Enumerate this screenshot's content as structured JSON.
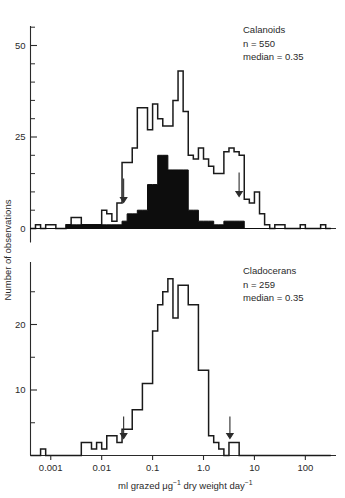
{
  "figure": {
    "y_axis_title": "Number of observations",
    "x_axis_title_parts": [
      "ml grazed ",
      "μg",
      "−1",
      " dry weight day",
      "−1"
    ],
    "x_axis_title_plain": "ml grazed μg⁻¹ dry weight day⁻¹"
  },
  "panels": [
    {
      "id": "calanoids",
      "annotation": {
        "taxon": "Calanoids",
        "n_label": "n  =  550",
        "median_label": "median  =  0.35"
      },
      "y_ticks_major": [
        0,
        25,
        50
      ],
      "y_tick_labels": [
        "0",
        "25",
        "50"
      ],
      "y_minor_step": 5,
      "y_max_axis": 60,
      "arrows": [
        0.027,
        5.0
      ]
    },
    {
      "id": "cladocerans",
      "annotation": {
        "taxon": "Cladocerans",
        "n_label": "n  =  259",
        "median_label": "median  =  0.35"
      },
      "y_ticks_major": [
        10,
        20
      ],
      "y_tick_labels": [
        "10",
        "20"
      ],
      "y_minor_step": 5,
      "y_max_axis": 30,
      "arrows": [
        0.027,
        3.3
      ]
    }
  ],
  "x_axis": {
    "scale": "log10",
    "tick_values": [
      0.001,
      0.01,
      0.1,
      1.0,
      10,
      100
    ],
    "tick_labels": [
      "0.001",
      "0.01",
      "0.1",
      "1.0",
      "10",
      "100"
    ],
    "min": 0.0004,
    "max": 400
  },
  "chart_data": {
    "type": "bar",
    "title": "",
    "subtitle": "",
    "xlabel": "ml grazed μg⁻¹ dry weight day⁻¹",
    "ylabel": "Number of observations",
    "grid": false,
    "legend_position": "none",
    "x_scale": "log10",
    "bin_width_decades": 0.1,
    "charts": [
      {
        "name": "Calanoids",
        "n": 550,
        "median": 0.35,
        "ylim": [
          0,
          60
        ],
        "yticks": [
          0,
          25,
          50
        ],
        "annotations": [
          "Calanoids",
          "n = 550",
          "median = 0.35"
        ],
        "arrow_x": [
          0.027,
          5.0
        ],
        "series": [
          {
            "name": "all observations (open outline)",
            "style": "open",
            "bin_left_log10": [
              -3.4,
              -3.3,
              -3.2,
              -3.1,
              -3.0,
              -2.9,
              -2.8,
              -2.7,
              -2.6,
              -2.5,
              -2.4,
              -2.3,
              -2.2,
              -2.1,
              -2.0,
              -1.9,
              -1.8,
              -1.7,
              -1.6,
              -1.5,
              -1.4,
              -1.3,
              -1.2,
              -1.1,
              -1.0,
              -0.9,
              -0.8,
              -0.7,
              -0.6,
              -0.5,
              -0.4,
              -0.3,
              -0.2,
              -0.1,
              0.0,
              0.1,
              0.2,
              0.3,
              0.4,
              0.5,
              0.6,
              0.7,
              0.8,
              0.9,
              1.0,
              1.1,
              1.2,
              1.3,
              1.4,
              1.5,
              1.6,
              1.7,
              1.8,
              1.9,
              2.0,
              2.1,
              2.2,
              2.3,
              2.4
            ],
            "values": [
              0,
              1,
              0,
              1,
              1,
              0,
              0,
              1,
              3,
              3,
              1,
              1,
              1,
              1,
              5,
              4,
              2,
              7,
              18,
              18,
              22,
              33,
              33,
              27,
              34,
              30,
              28,
              28,
              35,
              43,
              32,
              20,
              19,
              22,
              19,
              17,
              15,
              15,
              21,
              22,
              21,
              20,
              8,
              7,
              10,
              4,
              1,
              0,
              1,
              1,
              0,
              0,
              0,
              1,
              0,
              0,
              0,
              1,
              0
            ]
          },
          {
            "name": "filtered subset (solid black)",
            "style": "filled",
            "bin_left_log10": [
              -3.4,
              -3.3,
              -3.2,
              -3.1,
              -3.0,
              -2.9,
              -2.8,
              -2.7,
              -2.6,
              -2.5,
              -2.4,
              -2.3,
              -2.2,
              -2.1,
              -2.0,
              -1.9,
              -1.8,
              -1.7,
              -1.6,
              -1.5,
              -1.4,
              -1.3,
              -1.2,
              -1.1,
              -1.0,
              -0.9,
              -0.8,
              -0.7,
              -0.6,
              -0.5,
              -0.4,
              -0.3,
              -0.2,
              -0.1,
              0.0,
              0.1,
              0.2,
              0.3,
              0.4,
              0.5,
              0.6,
              0.7,
              0.8,
              0.9,
              1.0,
              1.1,
              1.2,
              1.3,
              1.4,
              1.5,
              1.6,
              1.7,
              1.8,
              1.9,
              2.0,
              2.1,
              2.2,
              2.3,
              2.4
            ],
            "values": [
              0,
              0,
              0,
              0,
              0,
              0,
              0,
              1,
              1,
              1,
              1,
              1,
              1,
              1,
              1,
              1,
              1,
              1,
              2,
              4,
              4,
              5,
              5,
              12,
              12,
              20,
              20,
              16,
              16,
              16,
              16,
              5,
              5,
              2,
              2,
              2,
              1,
              1,
              2,
              2,
              2,
              2,
              0,
              0,
              0,
              0,
              0,
              0,
              0,
              0,
              0,
              0,
              0,
              0,
              0,
              0,
              0,
              0,
              0
            ]
          }
        ]
      },
      {
        "name": "Cladocerans",
        "n": 259,
        "median": 0.35,
        "ylim": [
          0,
          30
        ],
        "yticks": [
          10,
          20
        ],
        "annotations": [
          "Cladocerans",
          "n = 259",
          "median = 0.35"
        ],
        "arrow_x": [
          0.027,
          3.3
        ],
        "series": [
          {
            "name": "all observations (open outline)",
            "style": "open",
            "bin_left_log10": [
              -3.4,
              -3.3,
              -3.2,
              -3.1,
              -3.0,
              -2.9,
              -2.8,
              -2.7,
              -2.6,
              -2.5,
              -2.4,
              -2.3,
              -2.2,
              -2.1,
              -2.0,
              -1.9,
              -1.8,
              -1.7,
              -1.6,
              -1.5,
              -1.4,
              -1.3,
              -1.2,
              -1.1,
              -1.0,
              -0.9,
              -0.8,
              -0.7,
              -0.6,
              -0.5,
              -0.4,
              -0.3,
              -0.2,
              -0.1,
              0.0,
              0.1,
              0.2,
              0.3,
              0.4,
              0.5,
              0.6,
              0.7,
              0.8,
              0.9,
              1.0,
              1.1,
              1.2,
              1.3,
              1.4,
              1.5,
              1.6,
              1.7,
              1.8,
              1.9,
              2.0,
              2.1,
              2.2,
              2.3,
              2.4
            ],
            "values": [
              0,
              0,
              1,
              0,
              0,
              0,
              0,
              0,
              0,
              0,
              2,
              2,
              1,
              2,
              1,
              3,
              3,
              2,
              4,
              4,
              7,
              7,
              11,
              11,
              19,
              23,
              25,
              27,
              21,
              26,
              26,
              23,
              23,
              13,
              13,
              3,
              2,
              1,
              0,
              2,
              2,
              0,
              0,
              0,
              0,
              0,
              0,
              0,
              0,
              0,
              0,
              0,
              0,
              0,
              0,
              0,
              0,
              0,
              0
            ]
          }
        ]
      }
    ]
  }
}
